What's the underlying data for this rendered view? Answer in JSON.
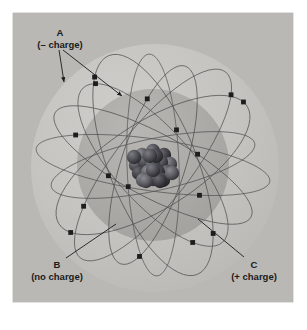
{
  "figure": {
    "frame": {
      "x": 13,
      "y": 13,
      "width": 280,
      "height": 289,
      "fill": "#b9b7b3",
      "border_color": "#6f6d6a"
    },
    "background_page": "#ffffff",
    "shells": [
      {
        "name": "outer-electron-cloud",
        "cx": 155,
        "cy": 168,
        "r": 124,
        "fill": "#c6c4c0"
      },
      {
        "name": "inner-electron-cloud",
        "cx": 153,
        "cy": 165,
        "r": 76,
        "fill": "#adaba7"
      }
    ],
    "nucleus": {
      "name": "nucleus-cluster",
      "cx": 153,
      "cy": 165,
      "radius": 22,
      "particle_color_dark": "#3a3a3c",
      "particle_color_mid": "#55555a",
      "particle_color_light": "#6e6e74",
      "particle_count": 22
    },
    "orbits": {
      "stroke": "#4a4a4a",
      "stroke_width": 0.7,
      "count": 9,
      "electron_color": "#1d1d1d",
      "electron_size": 2.4,
      "electron_count": 24
    },
    "labels": [
      {
        "id": "A",
        "name": "label-a-negative-charge",
        "letter": "A",
        "charge": "(– charge)",
        "letter_x": 60,
        "letter_y": 33,
        "charge_x": 60,
        "charge_y": 45,
        "leaders": [
          {
            "name": "leader-a-left",
            "x1": 59,
            "y1": 50,
            "x2": 64,
            "y2": 82
          },
          {
            "name": "leader-a-right",
            "x1": 63,
            "y1": 50,
            "x2": 122,
            "y2": 96
          }
        ]
      },
      {
        "id": "B",
        "name": "label-b-no-charge",
        "letter": "B",
        "charge": "(no charge)",
        "letter_x": 57,
        "letter_y": 267,
        "charge_x": 57,
        "charge_y": 279,
        "leaders": [
          {
            "name": "leader-b",
            "x1": 66,
            "y1": 258,
            "x2": 116,
            "y2": 224
          }
        ]
      },
      {
        "id": "C",
        "name": "label-c-positive-charge",
        "letter": "C",
        "charge": "(+ charge)",
        "letter_x": 254,
        "letter_y": 267,
        "charge_x": 254,
        "charge_y": 279,
        "leaders": [
          {
            "name": "leader-c",
            "x1": 244,
            "y1": 257,
            "x2": 198,
            "y2": 219
          }
        ]
      }
    ]
  }
}
